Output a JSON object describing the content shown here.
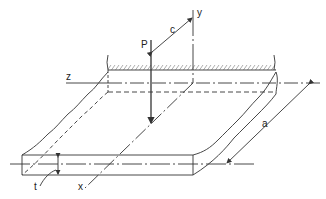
{
  "diagram": {
    "type": "plate-with-point-load",
    "labels": {
      "load": "P",
      "offset": "c",
      "y_axis": "y",
      "z_axis": "z",
      "x_axis": "x",
      "width": "a",
      "thickness": "t"
    },
    "colors": {
      "line": "#333333",
      "background": "#ffffff"
    }
  }
}
